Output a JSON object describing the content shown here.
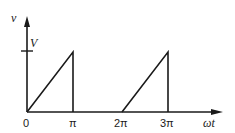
{
  "diagram": {
    "type": "waveform",
    "y_axis": {
      "label": "v",
      "tick_label": "V"
    },
    "x_axis": {
      "label": "ωt",
      "ticks": [
        "0",
        "π",
        "2π",
        "3π"
      ]
    },
    "colors": {
      "line": "#1a1a1a",
      "background": "#ffffff"
    },
    "segments": [
      {
        "from": "0",
        "to": "π",
        "shape": "linear ramp 0 to V, then vertical drop at π"
      },
      {
        "from": "π",
        "to": "2π",
        "shape": "zero"
      },
      {
        "from": "2π",
        "to": "3π",
        "shape": "linear ramp 0 to V, then vertical drop at 3π"
      }
    ]
  }
}
